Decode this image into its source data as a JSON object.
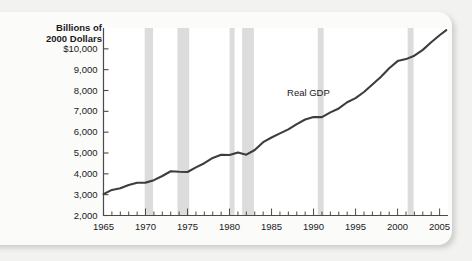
{
  "figure": {
    "background_color": "#f2f2f0",
    "card_color": "#fbfbfa"
  },
  "ghost": {
    "watermark_text": "FIGURE"
  },
  "chart_data": {
    "type": "line",
    "title": "",
    "subtitle": "",
    "ylabel": "Billions of\n2000 Dollars",
    "xlabel": "",
    "series_label": "Real GDP",
    "grid": false,
    "legend_position": "inline-annotation",
    "xlim": [
      1965,
      2006
    ],
    "ylim": [
      2000,
      11000
    ],
    "y_tick_labels": [
      "$10,000",
      "9,000",
      "8,000",
      "7,000",
      "6,000",
      "5,000",
      "4,000",
      "3,000",
      "2,000"
    ],
    "y_tick_values": [
      10000,
      9000,
      8000,
      7000,
      6000,
      5000,
      4000,
      3000,
      2000
    ],
    "x_tick_labels": [
      "1965",
      "1970",
      "1975",
      "1980",
      "1985",
      "1990",
      "1995",
      "2000",
      "2005"
    ],
    "x_tick_values": [
      1965,
      1970,
      1975,
      1980,
      1985,
      1990,
      1995,
      2000,
      2005
    ],
    "x_minor_tick_interval": 1,
    "line_color": "#3d3d3d",
    "recession_band_color": "#dcdcdc",
    "recession_bands": [
      {
        "start": 1969.9,
        "end": 1970.9
      },
      {
        "start": 1973.8,
        "end": 1975.2
      },
      {
        "start": 1980.0,
        "end": 1980.6
      },
      {
        "start": 1981.5,
        "end": 1982.9
      },
      {
        "start": 1990.5,
        "end": 1991.2
      },
      {
        "start": 2001.2,
        "end": 2001.9
      }
    ],
    "x": [
      1965,
      1966,
      1967,
      1968,
      1969,
      1970,
      1971,
      1972,
      1973,
      1974,
      1975,
      1976,
      1977,
      1978,
      1979,
      1980,
      1981,
      1982,
      1983,
      1984,
      1985,
      1986,
      1987,
      1988,
      1989,
      1990,
      1991,
      1992,
      1993,
      1994,
      1995,
      1996,
      1997,
      1998,
      1999,
      2000,
      2001,
      2002,
      2003,
      2004,
      2005,
      2005.8
    ],
    "values": [
      3028,
      3228,
      3306,
      3466,
      3572,
      3578,
      3697,
      3898,
      4124,
      4100,
      4086,
      4312,
      4511,
      4761,
      4913,
      4901,
      5022,
      4920,
      5144,
      5519,
      5744,
      5940,
      6134,
      6389,
      6610,
      6731,
      6720,
      6951,
      7139,
      7437,
      7632,
      7927,
      8287,
      8650,
      9070,
      9412,
      9507,
      9670,
      9951,
      10316,
      10652,
      10900
    ]
  }
}
